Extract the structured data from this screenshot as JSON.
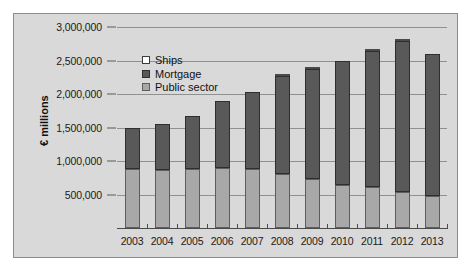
{
  "chart_data": {
    "type": "bar",
    "stacked": true,
    "title": "",
    "xlabel": "",
    "ylabel": "€ millions",
    "categories": [
      "2003",
      "2004",
      "2005",
      "2006",
      "2007",
      "2008",
      "2009",
      "2010",
      "2011",
      "2012",
      "2013"
    ],
    "series": [
      {
        "name": "Public sector",
        "color": "#a8a8a8",
        "values": [
          880000,
          870000,
          885000,
          900000,
          880000,
          810000,
          730000,
          635000,
          605000,
          535000,
          480000
        ]
      },
      {
        "name": "Mortgage",
        "color": "#595959",
        "values": [
          620000,
          680000,
          785000,
          995000,
          1155000,
          1455000,
          1640000,
          1865000,
          2035000,
          2255000,
          2115000
        ]
      },
      {
        "name": "Ships",
        "color": "#ffffff",
        "values": [
          0,
          0,
          0,
          0,
          0,
          25000,
          25000,
          0,
          25000,
          20000,
          0
        ]
      }
    ],
    "totals": [
      1500000,
      1550000,
      1670000,
      1895000,
      2035000,
      2290000,
      2395000,
      2500000,
      2665000,
      2810000,
      2595000
    ],
    "ytick_labels": [
      "3,000,000",
      "2,500,000",
      "2,000,000",
      "1,500,000",
      "1,000,000",
      "500,000"
    ],
    "ytick_values": [
      3000000,
      2500000,
      2000000,
      1500000,
      1000000,
      500000
    ],
    "ylim": [
      0,
      3000000
    ],
    "grid": true,
    "legend_position": "upper-left",
    "legend": [
      {
        "label": "Ships",
        "swatch": "white"
      },
      {
        "label": "Mortgage",
        "swatch": "dark-gray"
      },
      {
        "label": "Public sector",
        "swatch": "medium-gray"
      }
    ]
  },
  "colors": {
    "panel_background": "#d9d9d9",
    "panel_border": "#8c8c8c",
    "gridline": "#909090",
    "axis": "#4a4a4a",
    "text": "#1a1a1a",
    "public_sector": "#a8a8a8",
    "mortgage": "#595959",
    "ships": "#ffffff"
  }
}
